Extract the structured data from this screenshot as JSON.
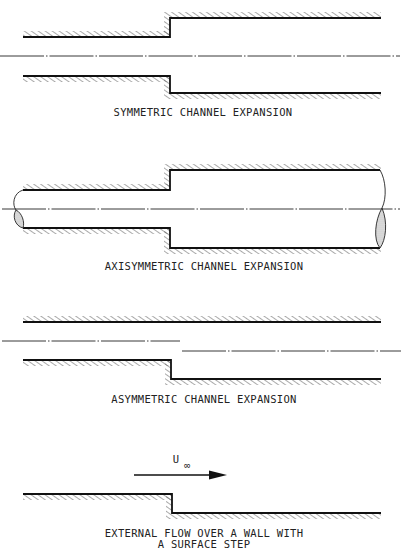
{
  "figure": {
    "panels": [
      {
        "id": "symmetric",
        "caption": "SYMMETRIC CHANNEL EXPANSION"
      },
      {
        "id": "axisymmetric",
        "caption": "AXISYMMETRIC CHANNEL EXPANSION"
      },
      {
        "id": "asymmetric",
        "caption": "ASYMMETRIC CHANNEL EXPANSION"
      },
      {
        "id": "external",
        "caption_line1": "EXTERNAL FLOW OVER A WALL WITH",
        "caption_line2": "A SURFACE STEP",
        "velocity_label": "U",
        "velocity_subscript": "∞"
      }
    ],
    "colors": {
      "line": "#111111",
      "hatch": "#555555",
      "section_fill": "#bbbbbb",
      "background": "#ffffff"
    }
  }
}
